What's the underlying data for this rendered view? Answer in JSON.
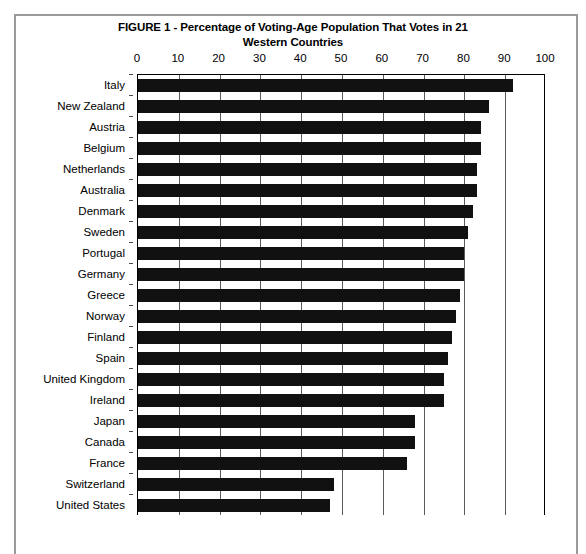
{
  "figure": {
    "title_line1": "FIGURE 1 - Percentage of Voting-Age Population That Votes in 21",
    "title_line2": "Western Countries"
  },
  "chart_data": {
    "type": "bar",
    "orientation": "horizontal",
    "title": "FIGURE 1 - Percentage of Voting-Age Population That Votes in 21 Western Countries",
    "xlabel": "",
    "ylabel": "",
    "xlim": [
      0,
      100
    ],
    "xticks": [
      0,
      10,
      20,
      30,
      40,
      50,
      60,
      70,
      80,
      90,
      100
    ],
    "grid": true,
    "grid_axis": "x",
    "legend": false,
    "bar_color": "#111111",
    "categories": [
      "Italy",
      "New Zealand",
      "Austria",
      "Belgium",
      "Netherlands",
      "Australia",
      "Denmark",
      "Sweden",
      "Portugal",
      "Germany",
      "Greece",
      "Norway",
      "Finland",
      "Spain",
      "United Kingdom",
      "Ireland",
      "Japan",
      "Canada",
      "France",
      "Switzerland",
      "United States"
    ],
    "values": [
      92,
      86,
      84,
      84,
      83,
      83,
      82,
      81,
      80,
      80,
      79,
      78,
      77,
      76,
      75,
      75,
      68,
      68,
      66,
      48,
      47
    ]
  }
}
